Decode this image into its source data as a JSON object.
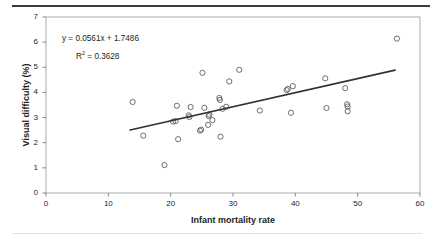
{
  "chart_data": {
    "type": "scatter",
    "title": "",
    "xlabel": "Infant mortality rate",
    "ylabel": "Visual difficulty (%)",
    "xlim": [
      0,
      60
    ],
    "ylim": [
      0,
      7
    ],
    "xticks": [
      0,
      10,
      20,
      30,
      40,
      50,
      60
    ],
    "yticks": [
      0,
      1,
      2,
      3,
      4,
      5,
      6,
      7
    ],
    "grid": false,
    "legend": null,
    "annotations": {
      "equation": "y = 0.0561x + 1.7486",
      "r_squared_prefix": "R",
      "r_squared_exponent": "2",
      "r_squared_value": " = 0.3628"
    },
    "trendline": {
      "slope": 0.0561,
      "intercept": 1.7486,
      "r_squared": 0.3628,
      "x_start": 13.5,
      "x_end": 56.0,
      "color": "#333333"
    },
    "marker": {
      "shape": "open-circle",
      "radius": 2.6,
      "stroke": "#555555",
      "fill": "none"
    },
    "points": [
      {
        "x": 13.9,
        "y": 3.62
      },
      {
        "x": 15.6,
        "y": 2.28
      },
      {
        "x": 19.0,
        "y": 1.11
      },
      {
        "x": 20.4,
        "y": 2.84
      },
      {
        "x": 20.8,
        "y": 2.86
      },
      {
        "x": 21.0,
        "y": 3.47
      },
      {
        "x": 21.2,
        "y": 2.14
      },
      {
        "x": 22.9,
        "y": 3.09
      },
      {
        "x": 23.0,
        "y": 3.02
      },
      {
        "x": 23.2,
        "y": 3.42
      },
      {
        "x": 24.7,
        "y": 2.48
      },
      {
        "x": 24.9,
        "y": 2.52
      },
      {
        "x": 25.1,
        "y": 4.78
      },
      {
        "x": 25.4,
        "y": 3.39
      },
      {
        "x": 26.0,
        "y": 2.71
      },
      {
        "x": 26.1,
        "y": 3.06
      },
      {
        "x": 26.2,
        "y": 3.12
      },
      {
        "x": 26.7,
        "y": 2.9
      },
      {
        "x": 27.8,
        "y": 3.78
      },
      {
        "x": 27.9,
        "y": 3.7
      },
      {
        "x": 28.0,
        "y": 2.24
      },
      {
        "x": 28.3,
        "y": 3.35
      },
      {
        "x": 28.9,
        "y": 3.43
      },
      {
        "x": 29.4,
        "y": 4.44
      },
      {
        "x": 31.0,
        "y": 4.9
      },
      {
        "x": 34.3,
        "y": 3.28
      },
      {
        "x": 38.6,
        "y": 4.09
      },
      {
        "x": 38.8,
        "y": 4.14
      },
      {
        "x": 39.3,
        "y": 3.19
      },
      {
        "x": 39.6,
        "y": 4.25
      },
      {
        "x": 44.8,
        "y": 4.56
      },
      {
        "x": 45.0,
        "y": 3.38
      },
      {
        "x": 48.0,
        "y": 4.17
      },
      {
        "x": 48.3,
        "y": 3.53
      },
      {
        "x": 48.4,
        "y": 3.44
      },
      {
        "x": 48.4,
        "y": 3.25
      },
      {
        "x": 56.3,
        "y": 6.14
      }
    ]
  }
}
